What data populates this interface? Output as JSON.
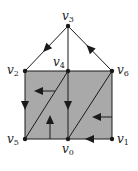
{
  "diagram": {
    "title": "",
    "colors": {
      "fill": "#a9a9a9",
      "stroke": "#1a1a1a",
      "background": "#ffffff"
    },
    "vertices": [
      {
        "id": "v0",
        "label": "v",
        "sub": "0",
        "x": 68,
        "y": 139,
        "label_x": 62,
        "label_y": 143
      },
      {
        "id": "v1",
        "label": "v",
        "sub": "1",
        "x": 112,
        "y": 139,
        "label_x": 117,
        "label_y": 133
      },
      {
        "id": "v2",
        "label": "v",
        "sub": "2",
        "x": 25,
        "y": 71,
        "label_x": 7,
        "label_y": 64
      },
      {
        "id": "v3",
        "label": "v",
        "sub": "3",
        "x": 68,
        "y": 26,
        "label_x": 62,
        "label_y": 10
      },
      {
        "id": "v4",
        "label": "v",
        "sub": "4",
        "x": 68,
        "y": 71,
        "label_x": 53,
        "label_y": 56
      },
      {
        "id": "v5",
        "label": "v",
        "sub": "5",
        "x": 25,
        "y": 139,
        "label_x": 7,
        "label_y": 133
      },
      {
        "id": "v6",
        "label": "v",
        "sub": "6",
        "x": 112,
        "y": 71,
        "label_x": 117,
        "label_y": 64
      }
    ],
    "filled_region": {
      "from": "v2",
      "to": "v1"
    },
    "edges": [
      {
        "from": "v3",
        "to": "v2",
        "arrow": "toward-end"
      },
      {
        "from": "v6",
        "to": "v3",
        "arrow": "toward-end"
      },
      {
        "from": "v3",
        "to": "v4",
        "arrow": "none"
      },
      {
        "from": "v2",
        "to": "v6",
        "arrow": "none"
      },
      {
        "from": "v2",
        "to": "v5",
        "arrow": "toward-end"
      },
      {
        "from": "v4",
        "to": "v0",
        "arrow": "toward-end"
      },
      {
        "from": "v6",
        "to": "v1",
        "arrow": "none"
      },
      {
        "from": "v5",
        "to": "v0",
        "arrow": "none"
      },
      {
        "from": "v1",
        "to": "v0",
        "arrow": "toward-end"
      },
      {
        "from": "v5",
        "to": "v4",
        "arrow": "none"
      },
      {
        "from": "v0",
        "to": "v6",
        "arrow": "none"
      }
    ],
    "flow_arrows": [
      {
        "name": "left-region-flow",
        "x1": 55,
        "y1": 91,
        "x2": 38,
        "y2": 91,
        "direction": "left"
      },
      {
        "name": "right-region-flow",
        "x1": 112,
        "y1": 117,
        "x2": 96,
        "y2": 117,
        "direction": "left"
      },
      {
        "name": "bottom-left-flow",
        "x1": 50,
        "y1": 139,
        "x2": 50,
        "y2": 119,
        "direction": "up"
      }
    ]
  }
}
